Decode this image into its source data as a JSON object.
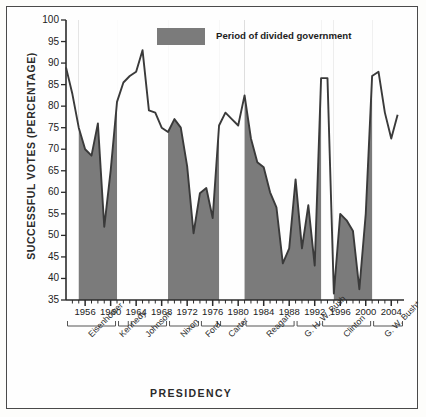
{
  "chart_data": {
    "type": "area",
    "title": "",
    "xlabel": "PRESIDENCY",
    "ylabel": "SUCCESSFUL VOTES (PERCENTAGE)",
    "ylim": [
      35,
      100
    ],
    "yticks": [
      35,
      40,
      45,
      50,
      55,
      60,
      65,
      70,
      75,
      80,
      85,
      90,
      95,
      100
    ],
    "xlim": [
      1953,
      2006
    ],
    "xticks": [
      1956,
      1960,
      1964,
      1968,
      1972,
      1976,
      1980,
      1984,
      1988,
      1992,
      1996,
      2000,
      2004
    ],
    "grid": false,
    "legend": {
      "position": "top-center",
      "entries": [
        {
          "label": "Period of divided government",
          "color": "#7b7b7b",
          "swatch": "filled-rect"
        }
      ]
    },
    "series": [
      {
        "name": "Successful votes (percentage)",
        "line_color": "#3a3a3a",
        "x": [
          1953,
          1954,
          1955,
          1956,
          1957,
          1958,
          1959,
          1960,
          1961,
          1962,
          1963,
          1964,
          1965,
          1966,
          1967,
          1968,
          1969,
          1970,
          1971,
          1972,
          1973,
          1974,
          1975,
          1976,
          1977,
          1978,
          1979,
          1980,
          1981,
          1982,
          1983,
          1984,
          1985,
          1986,
          1987,
          1988,
          1989,
          1990,
          1991,
          1992,
          1993,
          1994,
          1995,
          1996,
          1997,
          1998,
          1999,
          2000,
          2001,
          2002,
          2003,
          2004,
          2005
        ],
        "values": [
          89.0,
          82.8,
          75.0,
          70.0,
          68.5,
          76.0,
          52.0,
          65.0,
          81.0,
          85.5,
          87.0,
          88.0,
          93.0,
          79.0,
          78.5,
          75.0,
          74.0,
          77.0,
          75.0,
          66.0,
          50.5,
          59.8,
          61.0,
          54.0,
          75.5,
          78.5,
          77.0,
          75.5,
          82.5,
          72.5,
          67.0,
          65.8,
          60.0,
          56.5,
          43.5,
          47.0,
          63.0,
          47.0,
          57.0,
          43.0,
          86.5,
          86.5,
          36.5,
          55.0,
          53.5,
          51.0,
          37.5,
          55.0,
          87.0,
          88.0,
          78.5,
          72.5,
          78.0
        ]
      }
    ],
    "shaded_regions": [
      {
        "label": "divided government",
        "start": 1955,
        "end": 1961,
        "color": "#7b7b7b"
      },
      {
        "label": "divided government",
        "start": 1969,
        "end": 1977,
        "color": "#7b7b7b"
      },
      {
        "label": "divided government",
        "start": 1981,
        "end": 1993,
        "color": "#7b7b7b"
      },
      {
        "label": "divided government",
        "start": 1995,
        "end": 2001,
        "color": "#7b7b7b"
      }
    ],
    "presidency_brackets": [
      {
        "name": "Eisenhower",
        "start": 1953,
        "end": 1961
      },
      {
        "name": "Kennedy",
        "start": 1961,
        "end": 1963
      },
      {
        "name": "Johnson",
        "start": 1963,
        "end": 1969
      },
      {
        "name": "Nixon",
        "start": 1969,
        "end": 1974
      },
      {
        "name": "Ford",
        "start": 1974,
        "end": 1977
      },
      {
        "name": "Carter",
        "start": 1977,
        "end": 1981
      },
      {
        "name": "Reagan",
        "start": 1981,
        "end": 1989
      },
      {
        "name": "G. H. W. Bush",
        "start": 1989,
        "end": 1993
      },
      {
        "name": "Clinton",
        "start": 1993,
        "end": 2001
      },
      {
        "name": "G. W. Bush*",
        "start": 2001,
        "end": 2006
      }
    ]
  }
}
